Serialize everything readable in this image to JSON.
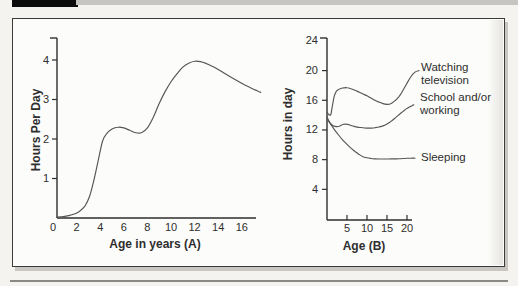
{
  "figure": {
    "page_background": "#f4f3f0",
    "panel_background": "#fcfcfa",
    "panel_border_color": "#3a3a3a",
    "ink": "#2e2e2e",
    "curve_color": "#555555",
    "header_bar_color": "#0c0c0c",
    "top_rule_color": "#c7c5c1",
    "bottom_rule_color": "#8b8986"
  },
  "chart_data": [
    {
      "type": "line",
      "title": "",
      "xlabel": "Age in years (A)",
      "ylabel": "Hours Per Day",
      "xticks": [
        0,
        2,
        4,
        6,
        8,
        10,
        12,
        14,
        16
      ],
      "yticks": [
        4,
        3,
        2,
        1
      ],
      "xlim": [
        0,
        18
      ],
      "ylim": [
        0,
        4.6
      ],
      "grid": false,
      "legend_position": "none",
      "series": [
        {
          "name": "",
          "label_lines": [],
          "points": [
            [
              0.3,
              0.02
            ],
            [
              1,
              0.04
            ],
            [
              1.6,
              0.08
            ],
            [
              2.2,
              0.16
            ],
            [
              2.7,
              0.3
            ],
            [
              3.1,
              0.55
            ],
            [
              3.5,
              1.0
            ],
            [
              3.9,
              1.55
            ],
            [
              4.2,
              1.95
            ],
            [
              4.5,
              2.12
            ],
            [
              5,
              2.25
            ],
            [
              5.5,
              2.3
            ],
            [
              6,
              2.28
            ],
            [
              6.5,
              2.22
            ],
            [
              7,
              2.16
            ],
            [
              7.5,
              2.16
            ],
            [
              8,
              2.28
            ],
            [
              8.5,
              2.55
            ],
            [
              9,
              2.9
            ],
            [
              9.5,
              3.2
            ],
            [
              10,
              3.45
            ],
            [
              10.5,
              3.65
            ],
            [
              11,
              3.82
            ],
            [
              11.5,
              3.92
            ],
            [
              12,
              3.97
            ],
            [
              12.5,
              3.96
            ],
            [
              13,
              3.91
            ],
            [
              13.5,
              3.84
            ],
            [
              14,
              3.76
            ],
            [
              14.7,
              3.63
            ],
            [
              15.5,
              3.49
            ],
            [
              16.3,
              3.36
            ],
            [
              17,
              3.26
            ],
            [
              17.6,
              3.18
            ]
          ]
        }
      ]
    },
    {
      "type": "line",
      "title": "",
      "xlabel": "Age (B)",
      "ylabel": "Hours in day",
      "xticks": [
        5,
        10,
        15,
        20
      ],
      "yticks": [
        24,
        20,
        16,
        12,
        8,
        4
      ],
      "xlim": [
        0,
        23
      ],
      "ylim": [
        0,
        24.5
      ],
      "grid": false,
      "legend_position": "right-of-curves",
      "series": [
        {
          "name": "Watching television",
          "label_lines": [
            "Watching",
            "television"
          ],
          "points": [
            [
              0,
              14.4
            ],
            [
              0.3,
              14.15
            ],
            [
              0.7,
              14.0
            ],
            [
              1.0,
              14.15
            ],
            [
              1.3,
              15.1
            ],
            [
              1.7,
              16.3
            ],
            [
              2.1,
              17.0
            ],
            [
              2.6,
              17.35
            ],
            [
              3.3,
              17.55
            ],
            [
              4,
              17.65
            ],
            [
              5,
              17.7
            ],
            [
              6,
              17.55
            ],
            [
              7,
              17.35
            ],
            [
              8,
              17.1
            ],
            [
              9,
              16.85
            ],
            [
              10,
              16.6
            ],
            [
              11,
              16.3
            ],
            [
              12,
              16.0
            ],
            [
              13,
              15.75
            ],
            [
              14,
              15.55
            ],
            [
              15,
              15.45
            ],
            [
              15.8,
              15.5
            ],
            [
              16.8,
              15.85
            ],
            [
              18,
              16.5
            ],
            [
              19,
              17.35
            ],
            [
              20,
              18.3
            ],
            [
              21,
              19.2
            ],
            [
              22,
              19.8
            ],
            [
              23,
              20.0
            ]
          ]
        },
        {
          "name": "School and/or working",
          "label_lines": [
            "School and/or",
            "working"
          ],
          "points": [
            [
              0,
              13.75
            ],
            [
              0.5,
              13.2
            ],
            [
              1,
              12.8
            ],
            [
              1.6,
              12.55
            ],
            [
              2.3,
              12.45
            ],
            [
              3,
              12.5
            ],
            [
              3.8,
              12.7
            ],
            [
              4.5,
              12.8
            ],
            [
              5.2,
              12.75
            ],
            [
              6,
              12.6
            ],
            [
              7,
              12.45
            ],
            [
              8,
              12.35
            ],
            [
              9,
              12.3
            ],
            [
              10,
              12.25
            ],
            [
              11,
              12.25
            ],
            [
              12,
              12.3
            ],
            [
              13,
              12.4
            ],
            [
              14,
              12.55
            ],
            [
              15,
              12.8
            ],
            [
              16,
              13.15
            ],
            [
              17,
              13.6
            ],
            [
              18,
              14.05
            ],
            [
              19,
              14.5
            ],
            [
              20,
              14.9
            ],
            [
              21,
              15.2
            ],
            [
              21.7,
              15.4
            ]
          ]
        },
        {
          "name": "Sleeping",
          "label_lines": [
            "Sleeping"
          ],
          "points": [
            [
              0,
              13.5
            ],
            [
              1,
              12.7
            ],
            [
              2,
              11.95
            ],
            [
              3,
              11.25
            ],
            [
              4,
              10.6
            ],
            [
              5,
              10.05
            ],
            [
              6,
              9.55
            ],
            [
              7,
              9.1
            ],
            [
              8,
              8.7
            ],
            [
              9,
              8.4
            ],
            [
              10,
              8.25
            ],
            [
              11,
              8.15
            ],
            [
              12,
              8.1
            ],
            [
              13,
              8.08
            ],
            [
              14,
              8.08
            ],
            [
              15,
              8.08
            ],
            [
              16,
              8.1
            ],
            [
              17,
              8.1
            ],
            [
              18,
              8.12
            ],
            [
              19,
              8.15
            ],
            [
              20,
              8.18
            ],
            [
              21,
              8.2
            ],
            [
              22,
              8.2
            ]
          ]
        }
      ]
    }
  ]
}
